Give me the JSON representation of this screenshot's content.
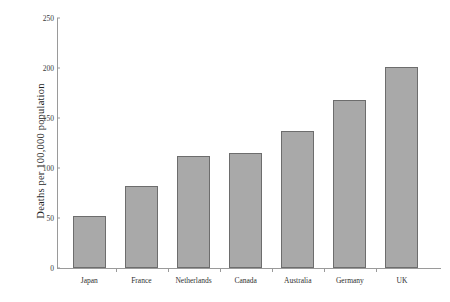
{
  "chart_data": {
    "type": "bar",
    "title": "",
    "subtitle": "",
    "xlabel": "",
    "ylabel": "Deaths per 100,000 population",
    "categories": [
      "Japan",
      "France",
      "Netherlands",
      "Canada",
      "Australia",
      "Germany",
      "UK"
    ],
    "values": [
      52,
      82,
      112,
      115,
      137,
      168,
      201
    ],
    "series": [
      {
        "name": "Deaths per 100,000 population",
        "values": [
          52,
          82,
          112,
          115,
          137,
          168,
          201
        ]
      }
    ],
    "ylim": [
      0,
      250
    ],
    "yticks": [
      0,
      50,
      100,
      150,
      200,
      250
    ],
    "ytick_labels": [
      "0",
      "50",
      "100",
      "150",
      "200",
      "250"
    ],
    "grid": false,
    "legend": false,
    "legend_position": "none",
    "bar_color": "#a9a9a9",
    "bar_edge_color": "#6d6d6d",
    "axis_color": "#9a9a9a",
    "background_color": "#ffffff",
    "text_color": "#2b2b2b",
    "annotations": []
  }
}
